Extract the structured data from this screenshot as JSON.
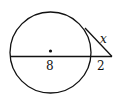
{
  "diagram": {
    "type": "circle-secant-tangent",
    "labels": {
      "tangent": "x",
      "internal_segment": "8",
      "external_segment": "2"
    },
    "colors": {
      "stroke": "#111111",
      "background": "#ffffff"
    }
  }
}
